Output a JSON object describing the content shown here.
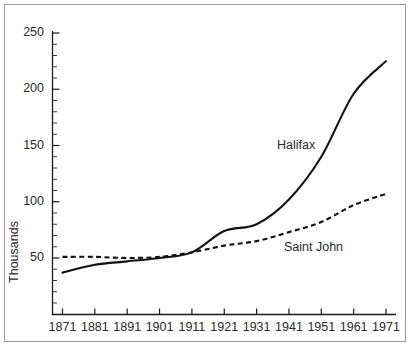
{
  "chart_data": {
    "type": "line",
    "title": "",
    "subtitle": "",
    "xlabel": "",
    "ylabel": "Thousands",
    "x": [
      1871,
      1881,
      1891,
      1901,
      1911,
      1921,
      1931,
      1941,
      1951,
      1961,
      1971
    ],
    "xlim": [
      1871,
      1971
    ],
    "ylim": [
      0,
      250
    ],
    "ytick_labels": [
      "50",
      "100",
      "150",
      "200",
      "250"
    ],
    "ytick_values": [
      50,
      100,
      150,
      200,
      250
    ],
    "yminor_step": 10,
    "xtick_labels": [
      "1871",
      "1881",
      "1891",
      "1901",
      "1911",
      "1921",
      "1931",
      "1941",
      "1951",
      "1961",
      "1971"
    ],
    "grid": false,
    "legend_position": "inline-annotation",
    "series": [
      {
        "name": "Halifax",
        "style": "solid",
        "color": "#111111",
        "label_x": 1939,
        "label_y": 152,
        "values": [
          37,
          44,
          47,
          50,
          55,
          74,
          80,
          102,
          140,
          196,
          225
        ]
      },
      {
        "name": "Saint John",
        "style": "dashed",
        "color": "#111111",
        "label_x": 1941,
        "label_y": 60,
        "values": [
          51,
          51,
          50,
          51,
          55,
          61,
          65,
          73,
          82,
          97,
          107
        ]
      }
    ],
    "annotations": [
      {
        "text": "Halifax",
        "series": "Halifax"
      },
      {
        "text": "Saint John",
        "series": "Saint John"
      }
    ]
  },
  "axes": {
    "y_title": "Thousands"
  },
  "colors": {
    "line": "#111111",
    "axis": "#1a1a1a",
    "text": "#2a2a2a",
    "frame": "#9a9a9a",
    "background": "#ffffff"
  }
}
